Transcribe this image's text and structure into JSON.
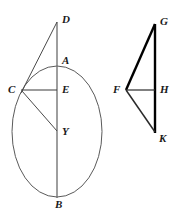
{
  "figure": {
    "canvas": {
      "width": 180,
      "height": 218,
      "background": "#ffffff"
    },
    "colors": {
      "stroke_thin": "#5a5a5a",
      "stroke_dark": "#3a3a3a",
      "stroke_bold": "#000000",
      "label": "#1a1a1a"
    },
    "left_figure": {
      "name": "ellipse-construction",
      "ellipse": {
        "cx": 57,
        "cy": 131.5,
        "rx": 45,
        "ry": 65.5
      },
      "points": [
        {
          "id": "D",
          "label": "D",
          "x": 57,
          "y": 22,
          "label_x": 62,
          "label_y": 14
        },
        {
          "id": "A",
          "label": "A",
          "x": 57,
          "y": 66,
          "label_x": 62,
          "label_y": 55
        },
        {
          "id": "C",
          "label": "C",
          "x": 22,
          "y": 90,
          "label_x": 8,
          "label_y": 84
        },
        {
          "id": "E",
          "label": "E",
          "x": 57,
          "y": 90,
          "label_x": 62,
          "label_y": 84
        },
        {
          "id": "Y",
          "label": "Y",
          "x": 57,
          "y": 131,
          "label_x": 62,
          "label_y": 126
        },
        {
          "id": "B",
          "label": "B",
          "x": 57,
          "y": 197,
          "label_x": 55,
          "label_y": 199
        }
      ],
      "segments": [
        {
          "id": "DB",
          "from": "D",
          "to": "B",
          "weight": "thin",
          "note": "vertical axis through A, E, Y"
        },
        {
          "id": "DC",
          "from": "D",
          "to": "C",
          "weight": "thin"
        },
        {
          "id": "CE",
          "from": "C",
          "to": "E",
          "weight": "thin"
        },
        {
          "id": "CY",
          "from": "C",
          "to": "Y",
          "weight": "thin"
        }
      ]
    },
    "right_figure": {
      "name": "triangle-construction",
      "points": [
        {
          "id": "G",
          "label": "G",
          "x": 155,
          "y": 25,
          "label_x": 160,
          "label_y": 16
        },
        {
          "id": "F",
          "label": "F",
          "x": 126,
          "y": 90,
          "label_x": 113,
          "label_y": 84
        },
        {
          "id": "H",
          "label": "H",
          "x": 155,
          "y": 90,
          "label_x": 160,
          "label_y": 84
        },
        {
          "id": "K",
          "label": "K",
          "x": 155,
          "y": 132,
          "label_x": 159,
          "label_y": 133
        }
      ],
      "segments": [
        {
          "id": "GK",
          "from": "G",
          "to": "K",
          "weight": "bold",
          "note": "vertical side through H"
        },
        {
          "id": "FG",
          "from": "F",
          "to": "G",
          "weight": "bold"
        },
        {
          "id": "FH",
          "from": "F",
          "to": "H",
          "weight": "thin"
        },
        {
          "id": "FK",
          "from": "F",
          "to": "K",
          "weight": "medium"
        }
      ]
    }
  }
}
